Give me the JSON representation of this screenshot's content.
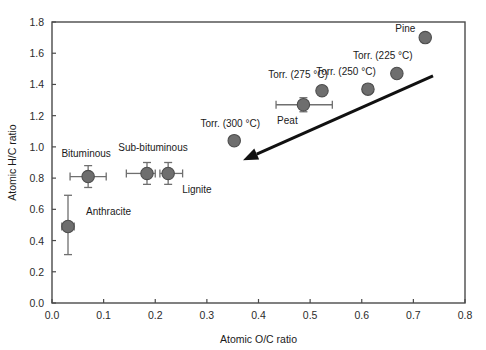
{
  "chart_data": {
    "type": "scatter",
    "title": "",
    "xlabel": "Atomic O/C ratio",
    "ylabel": "Atomic H/C ratio",
    "xlim": [
      0.0,
      0.8
    ],
    "ylim": [
      0.0,
      1.8
    ],
    "xticks": [
      "0.0",
      "0.1",
      "0.2",
      "0.3",
      "0.4",
      "0.5",
      "0.6",
      "0.7",
      "0.8"
    ],
    "xtick_values": [
      0.0,
      0.1,
      0.2,
      0.3,
      0.4,
      0.5,
      0.6,
      0.7,
      0.8
    ],
    "yticks": [
      "0.0",
      "0.2",
      "0.4",
      "0.6",
      "0.8",
      "1.0",
      "1.2",
      "1.4",
      "1.6",
      "1.8"
    ],
    "ytick_values": [
      0.0,
      0.2,
      0.4,
      0.6,
      0.8,
      1.0,
      1.2,
      1.4,
      1.6,
      1.8
    ],
    "grid": false,
    "legend": "none",
    "marker_color": "#6e6e6e",
    "marker_edge_color": "#4d4d4d",
    "errorbar_color": "#6f6f6f",
    "arrow_color": "#111111",
    "points": [
      {
        "label": "Anthracite",
        "x": 0.031,
        "y": 0.49,
        "xerr": [
          0.012,
          0.012
        ],
        "yerr": [
          0.18,
          0.2
        ],
        "label_dx": 18,
        "label_dy": -12,
        "label_anchor": "start"
      },
      {
        "label": "Bituminous",
        "x": 0.07,
        "y": 0.81,
        "xerr": [
          0.035,
          0.035
        ],
        "yerr": [
          0.07,
          0.07
        ],
        "label_dx": -2,
        "label_dy": -20,
        "label_anchor": "middle"
      },
      {
        "label": "Sub-bituminous",
        "x": 0.184,
        "y": 0.83,
        "xerr": [
          0.04,
          0.016
        ],
        "yerr": [
          0.07,
          0.07
        ],
        "label_dx": 6,
        "label_dy": -22,
        "label_anchor": "middle"
      },
      {
        "label": "Lignite",
        "x": 0.225,
        "y": 0.83,
        "xerr": [
          0.016,
          0.028
        ],
        "yerr": [
          0.07,
          0.07
        ],
        "label_dx": 14,
        "label_dy": 20,
        "label_anchor": "start"
      },
      {
        "label": "Torr. (300 °C)",
        "x": 0.353,
        "y": 1.04,
        "xerr": [
          0,
          0
        ],
        "yerr": [
          0,
          0
        ],
        "label_dx": -4,
        "label_dy": -14,
        "label_anchor": "middle"
      },
      {
        "label": "Peat",
        "x": 0.487,
        "y": 1.27,
        "xerr": [
          0.053,
          0.056
        ],
        "yerr": [
          0.045,
          0.045
        ],
        "label_dx": -16,
        "label_dy": 19,
        "label_anchor": "middle"
      },
      {
        "label": "Torr. (275 °C)",
        "x": 0.523,
        "y": 1.36,
        "xerr": [
          0,
          0
        ],
        "yerr": [
          0,
          0
        ],
        "label_dx": -24,
        "label_dy": -13,
        "label_anchor": "middle"
      },
      {
        "label": "Torr. (250 °C)",
        "x": 0.612,
        "y": 1.37,
        "xerr": [
          0,
          0
        ],
        "yerr": [
          0,
          0
        ],
        "label_dx": -22,
        "label_dy": -14,
        "label_anchor": "middle"
      },
      {
        "label": "Torr. (225 °C)",
        "x": 0.668,
        "y": 1.47,
        "xerr": [
          0,
          0
        ],
        "yerr": [
          0,
          0
        ],
        "label_dx": -14,
        "label_dy": -15,
        "label_anchor": "middle"
      },
      {
        "label": "Pine",
        "x": 0.723,
        "y": 1.7,
        "xerr": [
          0,
          0
        ],
        "yerr": [
          0,
          0
        ],
        "label_dx": -20,
        "label_dy": -6,
        "label_anchor": "middle"
      }
    ],
    "annotations": [
      {
        "name": "torrefaction-trend-arrow",
        "type": "arrow",
        "from": [
          0.738,
          1.455
        ],
        "to": [
          0.37,
          0.915
        ]
      }
    ]
  }
}
